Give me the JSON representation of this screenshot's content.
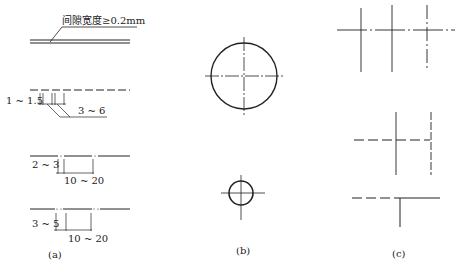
{
  "panel_a": {
    "caption": "(a)",
    "gap_annotation": "间隙宽度≥0.2mm",
    "dashed_labels": {
      "gap": "1 ~ 1.5",
      "dash": "3 ~ 6"
    },
    "chain_labels": {
      "gap": "2 ~ 3",
      "dash": "10 ~ 20"
    },
    "double_chain_labels": {
      "gap": "3 ~ 5",
      "dash": "10 ~ 20"
    }
  },
  "panel_b": {
    "caption": "(b)"
  },
  "panel_c": {
    "caption": "(c)"
  },
  "colors": {
    "line": "#222222",
    "background": "#ffffff"
  }
}
